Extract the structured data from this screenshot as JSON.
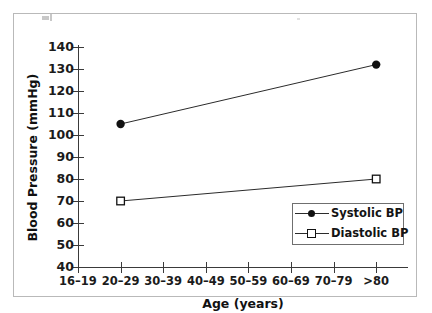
{
  "figure": {
    "background_color": "#ffffff",
    "frame_color": "#b9b9b9",
    "axis_color": "#3a3a3a",
    "line_color": "#2b2b2b",
    "marker_color": "#111111"
  },
  "chart_data": {
    "type": "line",
    "title": "",
    "subtitle": "",
    "xlabel": "Age (years)",
    "ylabel": "Blood Pressure (mmHg)",
    "categories": [
      "16–19",
      "20–29",
      "30–39",
      "40–49",
      "50–59",
      "60–69",
      "70–79",
      ">80"
    ],
    "ylim": [
      40,
      140
    ],
    "yticks": [
      40,
      50,
      60,
      70,
      80,
      90,
      100,
      110,
      120,
      130,
      140
    ],
    "ytick_labels": [
      "40",
      "50",
      "60",
      "70",
      "80",
      "90",
      "100",
      "110",
      "120",
      "130",
      "140"
    ],
    "grid": false,
    "legend_position": "lower right",
    "series": [
      {
        "name": "Systolic BP",
        "marker": "filled-circle",
        "points": [
          {
            "category": "16–19",
            "x_index": 1,
            "value": 105
          },
          {
            "category": "70–79",
            "x_index": 7,
            "value": 132
          }
        ],
        "values": [
          null,
          105,
          null,
          null,
          null,
          null,
          null,
          132
        ]
      },
      {
        "name": "Diastolic BP",
        "marker": "open-square",
        "points": [
          {
            "category": "16–19",
            "x_index": 1,
            "value": 70
          },
          {
            "category": "70–79",
            "x_index": 7,
            "value": 80
          }
        ],
        "values": [
          null,
          70,
          null,
          null,
          null,
          null,
          null,
          80
        ]
      }
    ]
  },
  "legend": {
    "entries": [
      {
        "label": "Systolic BP",
        "marker": "filled-circle"
      },
      {
        "label": "Diastolic BP",
        "marker": "open-square"
      }
    ]
  }
}
